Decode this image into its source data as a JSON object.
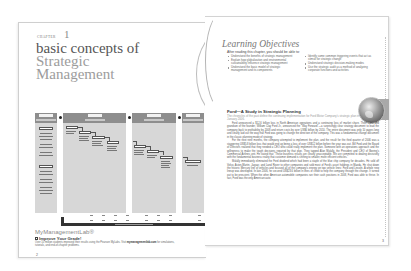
{
  "left_page": {
    "chapter_label": "CHAPTER",
    "chapter_number": "1",
    "title_line1": "basic concepts of",
    "title_line2": "Strategic",
    "title_line3": "Management",
    "diagram": {
      "columns": [
        {
          "heading": "Environmental Scanning",
          "left": 0,
          "width": 22
        },
        {
          "heading": "Strategy Formulation",
          "left": 28,
          "width": 63
        },
        {
          "heading": "Strategy Implementation",
          "left": 97,
          "width": 44
        },
        {
          "heading": "Evaluation and Control",
          "left": 147,
          "width": 22
        }
      ],
      "left_column_items": [
        "External",
        "Societal Environment",
        "Task Environment",
        "Internal",
        "Structure",
        "Culture",
        "Resources"
      ],
      "formulation_steps": [
        "Mission",
        "Objectives",
        "Strategies",
        "Policies"
      ],
      "implementation_steps": [
        "Programs",
        "Budgets",
        "Procedures"
      ],
      "evaluation_steps": [
        "Performance"
      ],
      "feedback_label": "Feedback/Learning: Make corrections as needed"
    },
    "mml": {
      "logo": "MyManagementLab®",
      "improve": "Improve Your Grade!",
      "text": "Over 10 million students improved their results using the Pearson MyLabs. Visit ",
      "link": "mymanagementlab.com",
      "text2": " for simulations, tutorials, and end-of-chapter problems."
    },
    "page_number": "2"
  },
  "right_page": {
    "lo_title": "Learning Objectives",
    "lo_intro": "After reading this chapter, you should be able to:",
    "lo_col1": [
      "Understand the benefits of strategic management",
      "Explain how globalization and environmental sustainability influence strategic management",
      "Understand the basic model of strategic management and its components"
    ],
    "lo_col2": [
      "Identify some common triggering events that act as stimuli for strategic change",
      "Understand strategic decision-making modes",
      "Use the strategic audit as a method of analyzing corporate functions and activities"
    ],
    "ford_title": "Ford—A Study in Strategic Planning",
    "ford_intro": "The chronicles of the past define the continuing implementation for Ford Motor Company's strategic plan in January 2006.",
    "ford_paragraphs": [
      "Ford announced a $12.6 billion loss in North American operations and a continuing loss of market share. Their CEO and grandson of the founder, William Clay Ford Jr., announced the \"Way Forward\"—a surprisingly clear strategy document to lead the company back to profitability by 2008 and return costs by over US$6 billion by 2010. The entire document was only 10 pages long and clearly laid out the way that Ford was going to change the direction of the company. This was a fundamental change document in the classic planning mode of strategy.",
      "For the next nine months, the company attempted to implement the plan, and the result for the third quarter of 2006 was a staggering US$5.8 billion loss that would end up being a loss of over US$12 billion before the year was out. Bill Ford and the Board of Directors realized that they needed a CEO who could really implement the plan. Someone with an operations approach and the willingness to make the tough decisions required by that plan. They tapped Alan Mulally, the President and CEO of Boeing's Commercial Airlines unit. He stated that \"These business results are clearly unacceptable. We are committed to dealing decisively with the fundamental business reality that customer demand is shifting to smaller, more efficient vehicles.\"",
      "Mulally immediately eliminated the Ford dividend which had been a staple of the blue chip company for decades. He sold off Volvo, Aston-Martin, Jaguar, and Land Rover to other companies and sold most of Ford's asset holdings in Mazda. He shut down the historic Mercury line of vehicles and focused all of the company's energy on two vehicle lines: Ford and Lincoln. A whole new lineup was developed. In late 2006, he secured US$23.6 billion in lines of credit to help the company through the change. It turned out to be prescient. When the other American automobile companies ran their cash positions in 2008, Ford was able to thrive. In fact, Ford was the only American auto"
    ],
    "page_number": "3"
  }
}
